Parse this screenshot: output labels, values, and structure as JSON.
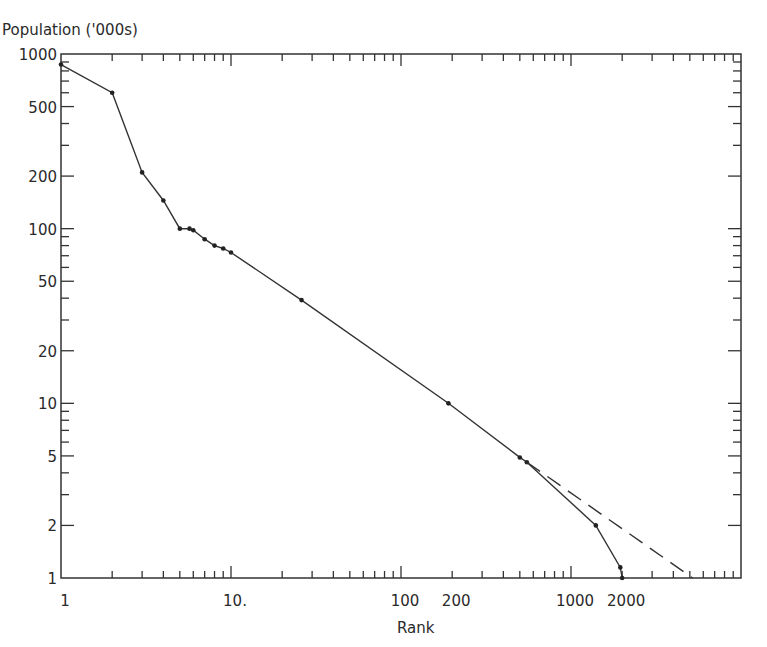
{
  "chart_data": {
    "type": "line",
    "title": "",
    "xlabel": "Rank",
    "ylabel": "Population ('000s)",
    "xscale": "log",
    "yscale": "log",
    "xlim": [
      1,
      10000
    ],
    "ylim": [
      1,
      1000
    ],
    "grid": false,
    "legend": null,
    "x_tick_labels": [
      {
        "value": 1,
        "label": "1"
      },
      {
        "value": 10,
        "label": "10."
      },
      {
        "value": 100,
        "label": "100"
      },
      {
        "value": 200,
        "label": "200"
      },
      {
        "value": 1000,
        "label": "1000"
      },
      {
        "value": 2000,
        "label": "2000"
      }
    ],
    "y_tick_labels": [
      {
        "value": 1000,
        "label": "1000"
      },
      {
        "value": 500,
        "label": "500"
      },
      {
        "value": 200,
        "label": "200"
      },
      {
        "value": 100,
        "label": "100"
      },
      {
        "value": 50,
        "label": "50"
      },
      {
        "value": 20,
        "label": "20"
      },
      {
        "value": 10,
        "label": "10"
      },
      {
        "value": 5,
        "label": "5"
      },
      {
        "value": 2,
        "label": "2"
      },
      {
        "value": 1,
        "label": "1"
      }
    ],
    "series": [
      {
        "name": "observed",
        "style": "solid",
        "markers": true,
        "x": [
          1,
          2,
          3,
          4,
          5,
          5.7,
          6,
          7,
          8,
          9,
          10,
          26,
          190,
          500,
          550,
          1400,
          1950,
          2000
        ],
        "y": [
          870,
          600,
          210,
          145,
          100,
          100,
          98,
          87,
          80,
          77,
          73,
          39,
          10,
          4.9,
          4.6,
          2.0,
          1.15,
          1.0
        ]
      },
      {
        "name": "rank-size extrapolation",
        "style": "dashed",
        "markers": false,
        "x": [
          550,
          5200
        ],
        "y": [
          4.6,
          1.0
        ]
      }
    ]
  }
}
